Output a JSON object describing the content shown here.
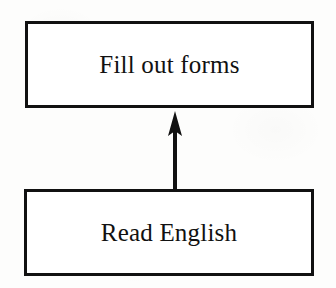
{
  "diagram": {
    "type": "flowchart",
    "orientation": "bottom-to-top",
    "background_color": "#fdfdfc",
    "stroke_color": "#111111",
    "nodes": [
      {
        "id": "fill-out-forms",
        "label": "Fill out forms",
        "shape": "rectangle",
        "position": "top"
      },
      {
        "id": "read-english",
        "label": "Read English",
        "shape": "rectangle",
        "position": "bottom"
      }
    ],
    "edges": [
      {
        "id": "read-english-to-fill-out-forms",
        "from": "read-english",
        "to": "fill-out-forms",
        "arrowhead": "solid-triangle",
        "direction": "up",
        "label": ""
      }
    ]
  }
}
